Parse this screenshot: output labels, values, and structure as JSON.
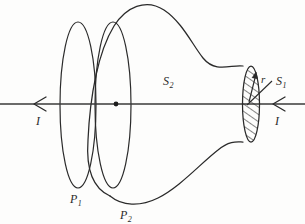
{
  "figure": {
    "type": "line-diagram",
    "background_color": "#fdfdfc",
    "ink_color": "#2a2a2a",
    "canvas": {
      "width": 305,
      "height": 224
    },
    "axis": {
      "name": "current-axis",
      "y": 104,
      "x_start": 0,
      "x_end": 305,
      "arrow_direction": "left"
    }
  },
  "labels": {
    "surface_outer": {
      "base": "S",
      "sub": "2",
      "x": 163,
      "y": 72
    },
    "surface_cap": {
      "base": "S",
      "sub": "1",
      "x": 276,
      "y": 80
    },
    "radius": {
      "base": "r",
      "sub": "",
      "x": 265,
      "y": 83
    },
    "plane_1": {
      "base": "P",
      "sub": "1",
      "x": 70,
      "y": 192
    },
    "plane_2": {
      "base": "P",
      "sub": "2",
      "x": 120,
      "y": 208
    },
    "current_left": {
      "base": "I",
      "sub": "",
      "x": 36,
      "y": 116
    },
    "current_right": {
      "base": "I",
      "sub": "",
      "x": 274,
      "y": 116
    }
  },
  "shapes": {
    "ellipse_p1": {
      "cx": 78,
      "cy": 105,
      "rx": 18,
      "ry": 83
    },
    "ellipse_p2": {
      "cx": 113,
      "cy": 105,
      "rx": 18,
      "ry": 83
    },
    "horn_outline": "bulbous flare narrowing left-to-right into the hatched cap",
    "cap_disk": {
      "cx": 251,
      "cy": 104,
      "rx": 8,
      "ry": 38,
      "hatching": "diagonal"
    },
    "center_dot": {
      "cx": 116,
      "cy": 104,
      "r": 2.3
    }
  }
}
